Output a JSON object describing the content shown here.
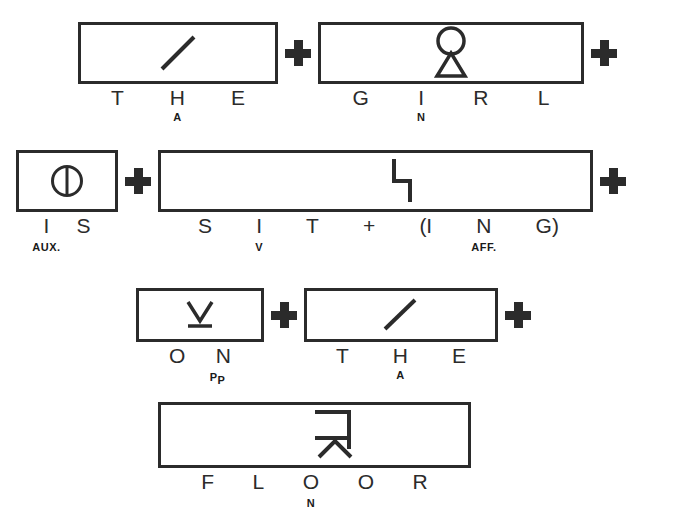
{
  "diagram": {
    "ink_color": "#2b2b2b",
    "background": "#ffffff",
    "connector_symbol": "+",
    "rows": [
      {
        "id": "row-1",
        "cells": [
          {
            "id": "cell-the-1",
            "word": "THE",
            "glyph": "slash-stroke",
            "letters": [
              {
                "char": "T",
                "sub": ""
              },
              {
                "char": "H",
                "sub": "A"
              },
              {
                "char": "E",
                "sub": ""
              }
            ]
          },
          {
            "id": "cell-girl",
            "word": "GIRL",
            "glyph": "circle-over-triangle",
            "letters": [
              {
                "char": "G",
                "sub": ""
              },
              {
                "char": "I",
                "sub": "N"
              },
              {
                "char": "R",
                "sub": ""
              },
              {
                "char": "L",
                "sub": ""
              }
            ]
          }
        ],
        "trailing_plus": true
      },
      {
        "id": "row-2",
        "cells": [
          {
            "id": "cell-is",
            "word": "IS",
            "glyph": "circle-with-vertical-bar",
            "letters": [
              {
                "char": "I",
                "sub": "AUX."
              },
              {
                "char": "S",
                "sub": ""
              }
            ]
          },
          {
            "id": "cell-sitting",
            "word": "SITTING",
            "glyph": "step-stroke",
            "letters": [
              {
                "char": "S",
                "sub": ""
              },
              {
                "char": "I",
                "sub": "V"
              },
              {
                "char": "T",
                "sub": ""
              },
              {
                "char": "+",
                "sub": ""
              },
              {
                "char": "(I",
                "sub": ""
              },
              {
                "char": "N",
                "sub": "AFF."
              },
              {
                "char": "G)",
                "sub": ""
              }
            ]
          }
        ],
        "trailing_plus": true
      },
      {
        "id": "row-3",
        "cells": [
          {
            "id": "cell-on",
            "word": "ON",
            "glyph": "v-over-underline",
            "letters": [
              {
                "char": "O",
                "sub": ""
              },
              {
                "char": "N",
                "sub": "PP"
              }
            ]
          },
          {
            "id": "cell-the-2",
            "word": "THE",
            "glyph": "slash-stroke",
            "letters": [
              {
                "char": "T",
                "sub": ""
              },
              {
                "char": "H",
                "sub": "A"
              },
              {
                "char": "E",
                "sub": ""
              }
            ]
          }
        ],
        "trailing_plus": true
      },
      {
        "id": "row-4",
        "cells": [
          {
            "id": "cell-floor",
            "word": "FLOOR",
            "glyph": "bracket-over-arrow",
            "letters": [
              {
                "char": "F",
                "sub": ""
              },
              {
                "char": "L",
                "sub": ""
              },
              {
                "char": "O",
                "sub": "N"
              },
              {
                "char": "O",
                "sub": ""
              },
              {
                "char": "R",
                "sub": ""
              }
            ]
          }
        ],
        "trailing_plus": false
      }
    ]
  }
}
